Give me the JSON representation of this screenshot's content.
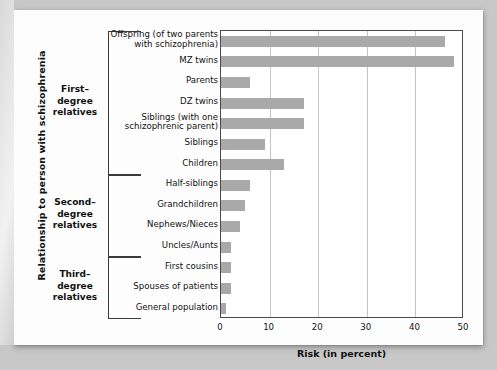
{
  "chart_data": {
    "type": "bar",
    "orientation": "horizontal",
    "title": "",
    "xlabel": "Risk (in percent)",
    "ylabel": "Relationship to person with schizophrenia",
    "xlim": [
      0,
      50
    ],
    "xticks": [
      0,
      10,
      20,
      30,
      40,
      50
    ],
    "grid": "vertical",
    "legend": "none",
    "bar_color": "#a9a9a9",
    "categories": [
      "Offspring (of two parents with schizophrenia)",
      "MZ twins",
      "Parents",
      "DZ twins",
      "Siblings (with one schizophrenic parent)",
      "Siblings",
      "Children",
      "Half-siblings",
      "Grandchildren",
      "Nephews/Nieces",
      "Uncles/Aunts",
      "First cousins",
      "Spouses  of patients",
      "General population"
    ],
    "values": [
      46,
      48,
      6,
      17,
      17,
      9,
      13,
      6,
      5,
      4,
      2,
      2,
      2,
      1
    ]
  },
  "axis": {
    "x_title": "Risk (in percent)",
    "y_title": "Relationship to person with schizophrenia",
    "tick_labels": [
      "0",
      "10",
      "20",
      "30",
      "40",
      "50"
    ]
  },
  "categories": [
    {
      "line1": "Offspring (of two parents",
      "line2": "with schizophrenia)"
    },
    {
      "line1": "MZ twins",
      "line2": ""
    },
    {
      "line1": "Parents",
      "line2": ""
    },
    {
      "line1": "DZ twins",
      "line2": ""
    },
    {
      "line1": "Siblings (with one",
      "line2": "schizophrenic parent)"
    },
    {
      "line1": "Siblings",
      "line2": ""
    },
    {
      "line1": "Children",
      "line2": ""
    },
    {
      "line1": "Half-siblings",
      "line2": ""
    },
    {
      "line1": "Grandchildren",
      "line2": ""
    },
    {
      "line1": "Nephews/Nieces",
      "line2": ""
    },
    {
      "line1": "Uncles/Aunts",
      "line2": ""
    },
    {
      "line1": "First cousins",
      "line2": ""
    },
    {
      "line1": "Spouses  of patients",
      "line2": ""
    },
    {
      "line1": "General population",
      "line2": ""
    }
  ],
  "groups": [
    {
      "line1": "First–",
      "line2": "degree",
      "line3": "relatives"
    },
    {
      "line1": "Second–",
      "line2": "degree",
      "line3": "relatives"
    },
    {
      "line1": "Third–",
      "line2": "degree",
      "line3": "relatives"
    }
  ]
}
